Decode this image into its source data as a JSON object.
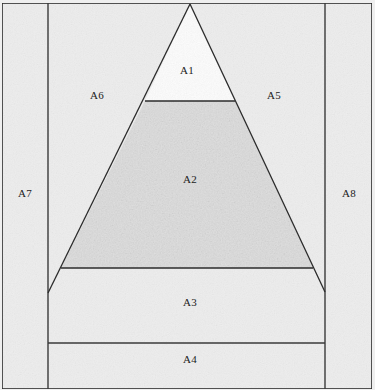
{
  "figure": {
    "canvas": {
      "width": 375,
      "height": 390
    },
    "colors": {
      "page_background": "#efefef",
      "paper_fill": "#ededed",
      "shaded_fill": "#dcdcdc",
      "white_fill": "#fbfbfb",
      "stroke": "#2b2b2b",
      "thin_stroke": "#3a3a3a",
      "label_color": "#222222"
    },
    "geometry": {
      "outer_border": {
        "x": 2,
        "y": 3,
        "width": 370,
        "height": 386
      },
      "left_divider_x": 48,
      "right_divider_x": 325,
      "apex": {
        "x": 190,
        "y": 4
      },
      "base_left": {
        "x": 48,
        "y": 293
      },
      "base_right": {
        "x": 325,
        "y": 292
      },
      "line_a1_a2": {
        "y": 101,
        "x1": 145,
        "x2": 235
      },
      "line_a2_a3": {
        "y": 268,
        "x1": 61,
        "x2": 313
      },
      "line_a3_a4": {
        "y": 343,
        "x1": 48,
        "x2": 325
      }
    }
  },
  "regions": [
    {
      "id": "A1",
      "label": "A1",
      "x": 187,
      "y": 71,
      "shaded": false,
      "description": "top sub-triangle above the upper cut line"
    },
    {
      "id": "A2",
      "label": "A2",
      "x": 190,
      "y": 180,
      "shaded": true,
      "description": "shaded middle trapezoid of the triangle"
    },
    {
      "id": "A3",
      "label": "A3",
      "x": 190,
      "y": 303,
      "shaded": false,
      "description": "band below the triangle base cut, above the lower rule"
    },
    {
      "id": "A4",
      "label": "A4",
      "x": 190,
      "y": 360,
      "shaded": false,
      "description": "bottom band of the central column"
    },
    {
      "id": "A5",
      "label": "A5",
      "x": 274,
      "y": 96,
      "shaded": false,
      "description": "right upper corner region outside the triangle"
    },
    {
      "id": "A6",
      "label": "A6",
      "x": 97,
      "y": 96,
      "shaded": false,
      "description": "left upper corner region outside the triangle"
    },
    {
      "id": "A7",
      "label": "A7",
      "x": 25,
      "y": 194,
      "shaded": false,
      "description": "left outer vertical strip"
    },
    {
      "id": "A8",
      "label": "A8",
      "x": 349,
      "y": 194,
      "shaded": false,
      "description": "right outer vertical strip"
    }
  ]
}
